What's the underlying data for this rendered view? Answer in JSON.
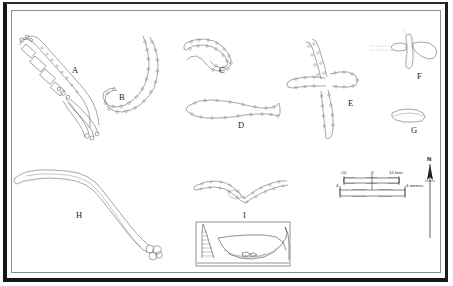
{
  "figure": {
    "background_color": "#ffffff",
    "frame_color": "#161616",
    "stone_outline_color": "#5d5d5d"
  },
  "features": [
    {
      "id": "A",
      "label": "A",
      "description": "elongated diagonal stone alignment with rectangular cist segments",
      "label_x": 72,
      "label_y": 71
    },
    {
      "id": "B",
      "label": "B",
      "description": "J-shaped double-line stone alignment",
      "label_x": 119,
      "label_y": 98
    },
    {
      "id": "C",
      "label": "C",
      "description": "curved open-ended stone enclosure outline",
      "label_x": 219,
      "label_y": 71
    },
    {
      "id": "D",
      "label": "D",
      "description": "elongated closed loop stone enclosure",
      "label_x": 238,
      "label_y": 126
    },
    {
      "id": "E",
      "label": "E",
      "description": "large cruciform stone arrangement",
      "label_x": 348,
      "label_y": 104
    },
    {
      "id": "F",
      "label": "F",
      "description": "small cruciform outline with attached lobe and dashed alignment",
      "label_x": 417,
      "label_y": 77
    },
    {
      "id": "G",
      "label": "G",
      "description": "small elongated oval outline",
      "label_x": 411,
      "label_y": 131
    },
    {
      "id": "H",
      "label": "H",
      "description": "long sinuous double-line bank terminating in circular cluster",
      "label_x": 76,
      "label_y": 216
    },
    {
      "id": "I",
      "label": "I",
      "description": "V-shaped boomerang feature in plan with section profile below",
      "label_x": 243,
      "label_y": 216
    }
  ],
  "scale_bars": [
    {
      "name": "feet-scale",
      "unit_label": "10 feet",
      "ticks": [
        "-10",
        "0",
        "10 feet"
      ],
      "left_label": "-10",
      "center_label": "0",
      "right_label": "10 feet"
    },
    {
      "name": "metres-scale",
      "unit_label": "4 metres",
      "left_label": "4",
      "right_label": "4 metres"
    }
  ],
  "north_arrow": {
    "label": "N",
    "name": "north-arrow"
  }
}
